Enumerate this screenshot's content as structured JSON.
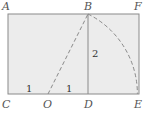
{
  "diagram": {
    "title": "",
    "colors": {
      "fill": "#ececec",
      "stroke": "#8a8a8a",
      "text": "#555555"
    },
    "points": {
      "A": "A",
      "B": "B",
      "F": "F",
      "C": "C",
      "O": "O",
      "D": "D",
      "E": "E"
    },
    "lengths": {
      "CO": "1",
      "OD": "1",
      "BD": "2"
    }
  }
}
